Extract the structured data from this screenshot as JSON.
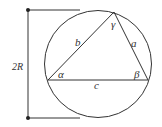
{
  "diagram": {
    "colors": {
      "stroke": "#333333",
      "background": "#ffffff"
    },
    "labels": {
      "diameter": "2R",
      "side_a": "a",
      "side_b": "b",
      "side_c": "c",
      "angle_alpha": "α",
      "angle_beta": "β",
      "angle_gamma": "γ"
    }
  }
}
